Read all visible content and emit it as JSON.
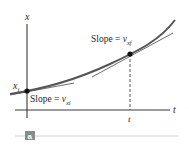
{
  "diagram": {
    "type": "position-time graph with tangent lines",
    "axes": {
      "vertical_label": "x",
      "horizontal_label": "t"
    },
    "initial_point": {
      "label": "x",
      "label_subscript": "i"
    },
    "time_tick": {
      "label": "t"
    },
    "slope_initial": {
      "text": "Slope = ",
      "var": "v",
      "subscript": "xi"
    },
    "slope_final": {
      "text": "Slope = ",
      "var": "v",
      "subscript": "xf"
    },
    "panel_badge": "a",
    "colors": {
      "curve": "#555555",
      "tangent": "#6e6e6e",
      "axis": "#3a3a3a",
      "point": "#111111",
      "badge_bg": "#8a8a8a",
      "rule": "#cfcfcf"
    }
  }
}
